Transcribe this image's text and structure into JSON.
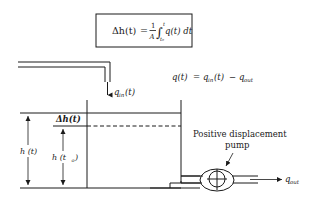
{
  "diagram": {
    "type": "tank-level-integration",
    "equation_box": {
      "lhs": "Δh(t)",
      "equals": "=",
      "frac_num": "1",
      "frac_den": "A",
      "integral": "∫",
      "upper_limit": "t",
      "lower_limit": "t₀",
      "integrand": "q(t) dt"
    },
    "flow_equation": {
      "lhs": "q(t)",
      "equals": "=",
      "term1": "q",
      "term1_sub": "in",
      "term1_arg": "(t)",
      "minus": "−",
      "term2": "q",
      "term2_sub": "out"
    },
    "labels": {
      "inflow": {
        "q": "q",
        "sub": "in",
        "arg": "(t)"
      },
      "outflow": {
        "q": "q",
        "sub": "out"
      },
      "delta_h": "Δh(t)",
      "h_t": "h (t)",
      "h_t0": "h (t",
      "h_t0_sub": "o",
      "h_t0_close": ")",
      "pump_line1": "Positive displacement",
      "pump_line2": "pump"
    },
    "colors": {
      "ink": "#1a1a1a",
      "background": "#ffffff"
    }
  }
}
